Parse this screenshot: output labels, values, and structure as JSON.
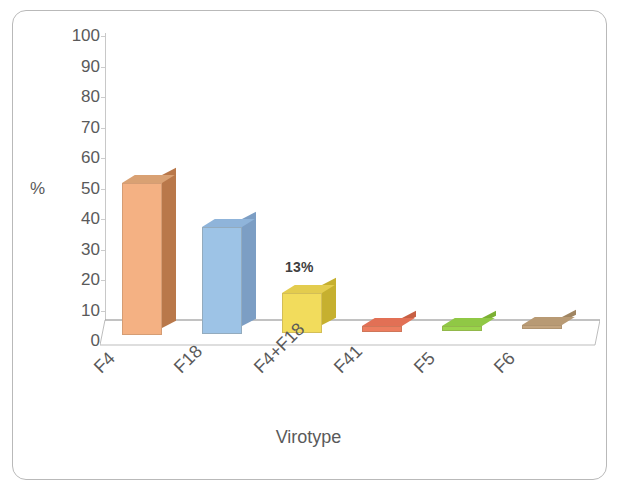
{
  "chart_data": {
    "type": "bar",
    "title": "",
    "xlabel": "Virotype",
    "ylabel": "%",
    "categories": [
      "F4",
      "F18",
      "F4+F18",
      "F41",
      "F5",
      "F6"
    ],
    "values": [
      50,
      35,
      13,
      2,
      1.5,
      1.5
    ],
    "ylim": [
      0,
      100
    ],
    "yticks": [
      "0",
      "10",
      "20",
      "30",
      "40",
      "50",
      "60",
      "70",
      "80",
      "90",
      "100"
    ],
    "grid": false,
    "legend": false,
    "style": "3d-column",
    "annotations": [
      {
        "text": "13%",
        "category": "F4+F18",
        "value": 13
      }
    ],
    "bar_colors": [
      {
        "category": "F4",
        "front": "#f4b183",
        "side": "#b9784a",
        "top": "#d9a173"
      },
      {
        "category": "F18",
        "front": "#9dc3e6",
        "side": "#7c9ec4",
        "top": "#8fb4da"
      },
      {
        "category": "F4+F18",
        "front": "#f2dc5c",
        "side": "#c6b02f",
        "top": "#e3cc4e"
      },
      {
        "category": "F41",
        "front": "#ed7d5f",
        "side": "#c75f43",
        "top": "#e27055"
      },
      {
        "category": "F5",
        "front": "#9bd44c",
        "side": "#7cb033",
        "top": "#90c845"
      },
      {
        "category": "F6",
        "front": "#c3a47e",
        "side": "#a08561",
        "top": "#b89a74"
      }
    ]
  },
  "axis": {
    "y_title": "%",
    "x_title": "Virotype"
  },
  "colors": {
    "frame_border": "#b9b9b9",
    "axis_line": "#c8c8c8",
    "tick_text": "#5a5a5a",
    "floor_line": "#b5b5b5",
    "background": "#ffffff"
  }
}
